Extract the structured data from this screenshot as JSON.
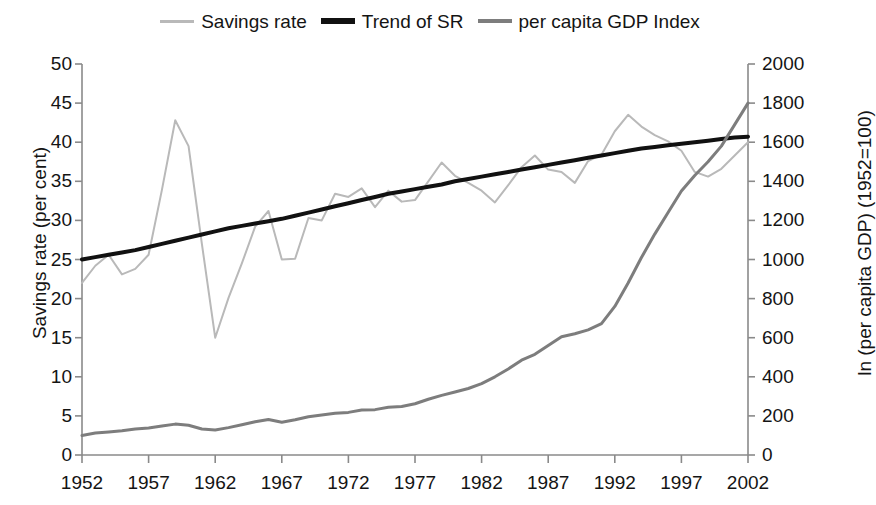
{
  "chart_data": {
    "type": "line",
    "title": "",
    "xlabel": "",
    "ylabel": "Savings rate (per cent)",
    "y2label": "ln (per capita GDP) (1952=100)",
    "grid": false,
    "legend_position": "top-center",
    "xlim": [
      1952,
      2002
    ],
    "ylim": [
      0,
      50
    ],
    "y2lim": [
      0,
      2000
    ],
    "xticks": [
      "1952",
      "1957",
      "1962",
      "1967",
      "1972",
      "1977",
      "1982",
      "1987",
      "1992",
      "1997",
      "2002"
    ],
    "yticks": [
      "0",
      "5",
      "10",
      "15",
      "20",
      "25",
      "30",
      "35",
      "40",
      "45",
      "50"
    ],
    "y2ticks": [
      "0",
      "200",
      "400",
      "600",
      "800",
      "1000",
      "1200",
      "1400",
      "1600",
      "1800",
      "2000"
    ],
    "x": [
      1952,
      1953,
      1954,
      1955,
      1956,
      1957,
      1958,
      1959,
      1960,
      1961,
      1962,
      1963,
      1964,
      1965,
      1966,
      1967,
      1968,
      1969,
      1970,
      1971,
      1972,
      1973,
      1974,
      1975,
      1976,
      1977,
      1978,
      1979,
      1980,
      1981,
      1982,
      1983,
      1984,
      1985,
      1986,
      1987,
      1988,
      1989,
      1990,
      1991,
      1992,
      1993,
      1994,
      1995,
      1996,
      1997,
      1998,
      1999,
      2000,
      2001,
      2002
    ],
    "series": [
      {
        "name": "Savings rate",
        "axis": "left",
        "color": "#b9b9b9",
        "width": 2,
        "values": [
          22.0,
          24.2,
          25.6,
          23.1,
          23.8,
          25.6,
          33.9,
          42.8,
          39.5,
          27.0,
          15.0,
          20.1,
          24.5,
          29.2,
          31.2,
          25.0,
          25.1,
          30.3,
          30.0,
          33.4,
          33.0,
          34.1,
          31.7,
          33.8,
          32.4,
          32.6,
          35.0,
          37.4,
          35.7,
          34.8,
          33.8,
          32.3,
          34.5,
          36.8,
          38.3,
          36.5,
          36.2,
          34.8,
          37.6,
          38.4,
          41.4,
          43.5,
          42.0,
          40.9,
          40.1,
          38.9,
          36.2,
          35.6,
          36.6,
          38.3,
          40.0
        ]
      },
      {
        "name": "Trend of SR",
        "axis": "left",
        "color": "#111111",
        "width": 4,
        "values": [
          25.0,
          25.3,
          25.6,
          25.9,
          26.2,
          26.6,
          27.0,
          27.4,
          27.8,
          28.2,
          28.6,
          29.0,
          29.3,
          29.6,
          29.9,
          30.2,
          30.6,
          31.0,
          31.4,
          31.8,
          32.2,
          32.6,
          33.0,
          33.4,
          33.7,
          34.0,
          34.3,
          34.6,
          35.0,
          35.3,
          35.6,
          35.9,
          36.2,
          36.5,
          36.8,
          37.1,
          37.4,
          37.7,
          38.0,
          38.3,
          38.6,
          38.9,
          39.2,
          39.4,
          39.6,
          39.8,
          40.0,
          40.2,
          40.4,
          40.6,
          40.7
        ]
      },
      {
        "name": "per capita GDP Index",
        "axis": "right",
        "color": "#7d7d7d",
        "width": 3,
        "values": [
          100,
          112,
          118,
          124,
          133,
          138,
          148,
          158,
          152,
          133,
          128,
          140,
          155,
          170,
          182,
          168,
          180,
          196,
          205,
          213,
          218,
          230,
          232,
          244,
          248,
          262,
          285,
          305,
          322,
          340,
          365,
          400,
          440,
          485,
          515,
          560,
          605,
          620,
          640,
          672,
          760,
          880,
          1010,
          1130,
          1240,
          1350,
          1430,
          1500,
          1580,
          1690,
          1800
        ]
      }
    ]
  },
  "legend": {
    "items": [
      {
        "label": "Savings rate",
        "color": "#b9b9b9",
        "thickness": 3
      },
      {
        "label": "Trend of SR",
        "color": "#111111",
        "thickness": 6
      },
      {
        "label": "per capita GDP Index",
        "color": "#7d7d7d",
        "thickness": 4
      }
    ]
  },
  "axes": {
    "left_title": "Savings rate (per cent)",
    "right_title": "ln (per capita GDP) (1952=100)"
  }
}
